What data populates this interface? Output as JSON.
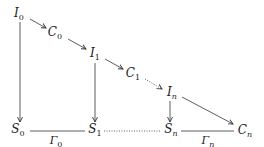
{
  "diagram": {
    "nodes": [
      {
        "id": "I0",
        "base": "I",
        "sub": "0",
        "x": 19,
        "y": 14
      },
      {
        "id": "C0",
        "base": "C",
        "sub": "0",
        "x": 55,
        "y": 33
      },
      {
        "id": "I1",
        "base": "I",
        "sub": "1",
        "x": 95,
        "y": 54
      },
      {
        "id": "C1",
        "base": "C",
        "sub": "1",
        "x": 133,
        "y": 74
      },
      {
        "id": "In",
        "base": "I",
        "sub": "n",
        "x": 172,
        "y": 93
      },
      {
        "id": "S0",
        "base": "S",
        "sub": "0",
        "x": 18,
        "y": 130
      },
      {
        "id": "S1",
        "base": "S",
        "sub": "1",
        "x": 95,
        "y": 130
      },
      {
        "id": "Sn",
        "base": "S",
        "sub": "n",
        "x": 171,
        "y": 130
      },
      {
        "id": "Cn",
        "base": "C",
        "sub": "n",
        "x": 245,
        "y": 131
      }
    ],
    "edge_labels": [
      {
        "id": "Gamma0",
        "base": "Γ",
        "sub": "0",
        "x": 56,
        "y": 142
      },
      {
        "id": "Gamman",
        "base": "Γ",
        "sub": "n",
        "x": 208,
        "y": 142
      }
    ],
    "edges": [
      {
        "from": "I0",
        "to": "C0",
        "style": "solid",
        "arrow": true
      },
      {
        "from": "C0",
        "to": "I1",
        "style": "solid",
        "arrow": true
      },
      {
        "from": "I1",
        "to": "C1",
        "style": "solid",
        "arrow": true
      },
      {
        "from": "C1",
        "to": "In",
        "style": "dotted",
        "arrow": true
      },
      {
        "from": "In",
        "to": "Cn",
        "style": "solid",
        "arrow": true
      },
      {
        "from": "I0",
        "to": "S0",
        "style": "solid",
        "arrow": true
      },
      {
        "from": "I1",
        "to": "S1",
        "style": "solid",
        "arrow": true
      },
      {
        "from": "In",
        "to": "Sn",
        "style": "solid",
        "arrow": true
      },
      {
        "from": "S0",
        "to": "S1",
        "style": "solid",
        "arrow": false,
        "label": "Γ0"
      },
      {
        "from": "S1",
        "to": "Sn",
        "style": "dotted",
        "arrow": false
      },
      {
        "from": "Sn",
        "to": "Cn",
        "style": "solid",
        "arrow": false,
        "label": "Γn"
      }
    ],
    "colors": {
      "stroke": "#333333",
      "text": "#222222",
      "background": "#ffffff"
    }
  }
}
